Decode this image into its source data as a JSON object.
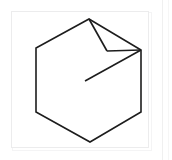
{
  "figure": {
    "name": "hexagon-with-folded-flap",
    "caption": "",
    "background_color": "#ffffff",
    "stroke_color": "#1d1d1d",
    "stroke_width": 1.6,
    "frame": {
      "color": "#ececed",
      "x": 11,
      "y": 11,
      "width": 138,
      "height": 137
    },
    "page_rule_color": "#f0f0f0",
    "shapes": [
      {
        "name": "hexagon-outline",
        "type": "polygon",
        "closed": true,
        "points": [
          [
            89,
            19
          ],
          [
            141,
            50
          ],
          [
            141,
            112
          ],
          [
            90,
            142
          ],
          [
            36,
            112
          ],
          [
            36,
            48
          ]
        ]
      },
      {
        "name": "flap-fold-left-edge",
        "type": "polyline",
        "closed": false,
        "points": [
          [
            89,
            19
          ],
          [
            107,
            51
          ]
        ]
      },
      {
        "name": "flap-fold-bottom-edge",
        "type": "polyline",
        "closed": false,
        "points": [
          [
            107,
            51
          ],
          [
            141,
            50
          ]
        ]
      },
      {
        "name": "interior-diagonal-crease",
        "type": "polyline",
        "closed": false,
        "points": [
          [
            141,
            50
          ],
          [
            85,
            81
          ]
        ]
      }
    ]
  }
}
